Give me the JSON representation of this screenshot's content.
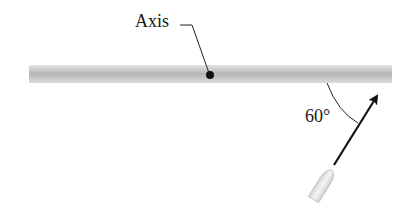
{
  "diagram": {
    "axis_label": "Axis",
    "angle_label": "60°",
    "elements": {
      "rod": "horizontal gray rod",
      "pivot": "black dot on rod (rotation axis)",
      "bullet": "bullet projectile",
      "velocity_arrow": "arrow pointing up-right toward rod"
    },
    "colors": {
      "rod": "#c8c8c8",
      "rod_dark": "#b0b0b0",
      "ink": "#111111",
      "bullet": "#e6e6e6"
    }
  }
}
